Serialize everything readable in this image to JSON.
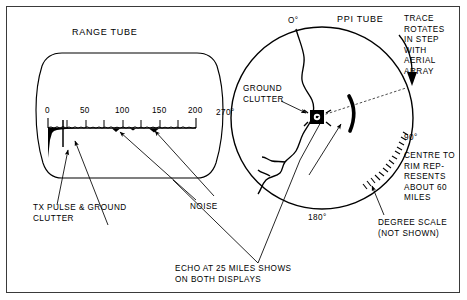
{
  "diagram": {
    "range_tube": {
      "title": "RANGE TUBE",
      "scale_labels": [
        "0",
        "50",
        "100",
        "150",
        "200"
      ],
      "annotations": {
        "tx_pulse": "TX PULSE & GROUND\nCLUTTER",
        "noise": "NOISE"
      }
    },
    "ppi_tube": {
      "title": "PPI TUBE",
      "bearings": {
        "north": "O°",
        "east": "90°",
        "south": "180°",
        "west": "270°"
      },
      "annotations": {
        "ground_clutter": "GROUND\nCLUTTER",
        "trace_rotates": "TRACE\nROTATES\nIN STEP\nWITH\nAERIAL\nARRAY",
        "centre_to_rim": "CENTRE TO\nRIM REP-\nRESENTS\nABOUT 60\nMILES",
        "degree_scale": "DEGREE SCALE\n(NOT SHOWN)"
      }
    },
    "caption": "ECHO AT 25 MILES SHOWS\nON BOTH DISPLAYS",
    "colors": {
      "ink": "#000000",
      "border": "#3a3a3a",
      "background": "#ffffff"
    }
  }
}
